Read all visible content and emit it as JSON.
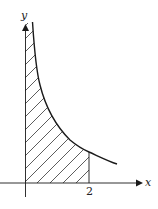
{
  "diagram": {
    "axes": {
      "x_label": "x",
      "y_label": "y"
    },
    "tick_labels": {
      "x_tick": "2"
    },
    "region": {
      "fill": "diagonal-hatch",
      "from_x": "0",
      "to_x": "2"
    },
    "colors": {
      "stroke": "#1a1a1a",
      "background": "#ffffff"
    }
  }
}
